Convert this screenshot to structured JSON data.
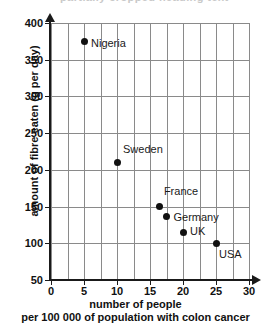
{
  "top_clip": {
    "text": "partially cropped heading text"
  },
  "chart_data": {
    "type": "scatter",
    "title": "",
    "xlabel_line1": "number of people",
    "xlabel_line2": "per 100 000 of population with colon cancer",
    "ylabel": "amount of fibre eaten (g per day)",
    "xlim": [
      0,
      30
    ],
    "ylim": [
      50,
      400
    ],
    "xticks": [
      0,
      5,
      10,
      15,
      20,
      25,
      30
    ],
    "yticks": [
      50,
      100,
      150,
      200,
      250,
      300,
      350,
      400
    ],
    "xtick_labels": [
      "0",
      "5",
      "10",
      "15",
      "20",
      "25",
      "30"
    ],
    "ytick_labels": [
      "50",
      "100",
      "150",
      "200",
      "250",
      "300",
      "350",
      "400"
    ],
    "grid": true,
    "grid_x_step": 2.5,
    "grid_y_step": 50,
    "legend": "none",
    "marker_color": "#111111",
    "grid_color": "#8a8a8a",
    "axis_color": "#1a1a1a",
    "points": [
      {
        "label": "Nigeria",
        "x": 5,
        "y": 375,
        "label_dx": 7,
        "label_dy": 2
      },
      {
        "label": "Sweden",
        "x": 10,
        "y": 210,
        "label_dx": 6,
        "label_dy": -14
      },
      {
        "label": "France",
        "x": 16.5,
        "y": 150,
        "label_dx": 4,
        "label_dy": -16
      },
      {
        "label": "Germany",
        "x": 17.5,
        "y": 137,
        "label_dx": 7,
        "label_dy": 1
      },
      {
        "label": "UK",
        "x": 20,
        "y": 115,
        "label_dx": 7,
        "label_dy": -1
      },
      {
        "label": "USA",
        "x": 25,
        "y": 100,
        "label_dx": 3,
        "label_dy": 11
      }
    ]
  }
}
